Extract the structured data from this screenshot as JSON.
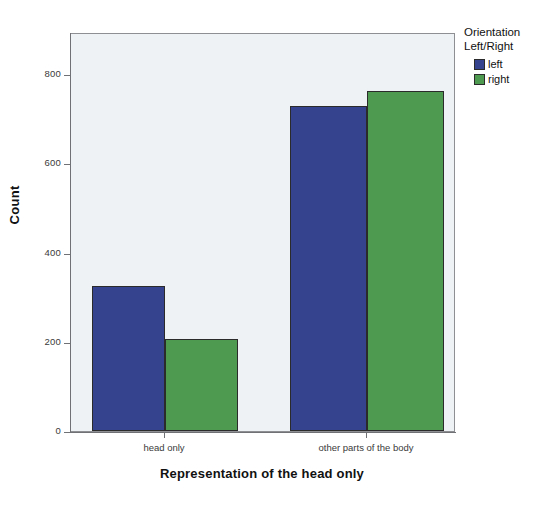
{
  "chart_data": {
    "type": "bar",
    "title": "",
    "subtitle": "",
    "xlabel": "Representation of the head only",
    "ylabel": "Count",
    "categories": [
      "head only",
      "other parts of the body"
    ],
    "series": [
      {
        "name": "left",
        "values": [
          324,
          728
        ],
        "color": "#35428d"
      },
      {
        "name": "right",
        "values": [
          206,
          763
        ],
        "color": "#4e9a51"
      }
    ],
    "ylim": [
      0,
      800
    ],
    "yticks": [
      0,
      200,
      400,
      600,
      800
    ],
    "ytick_labels": [
      "0",
      "200",
      "400",
      "600",
      "800"
    ],
    "grid": false,
    "legend": {
      "position": "right",
      "title_lines": [
        "Orientation",
        "Left/Right"
      ],
      "entries": [
        {
          "label": "left",
          "color": "#35428d"
        },
        {
          "label": "right",
          "color": "#4e9a51"
        }
      ]
    },
    "plot_background": "#eff2f5",
    "axis_color": "#6f7174",
    "bar_edge_color": "#2b2b2b"
  }
}
